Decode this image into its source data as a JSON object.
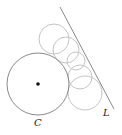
{
  "diagram": {
    "labels": {
      "circle": "C",
      "line": "L"
    },
    "colors": {
      "main_circle": "#8a8a8a",
      "line": "#8a8a8a",
      "small_circles": "#c4c4c4",
      "center_dot": "#111111"
    },
    "main_circle": {
      "cx": 38,
      "cy": 84,
      "r": 31
    },
    "center_dot": {
      "cx": 38,
      "cy": 84,
      "r": 1.8
    },
    "line": {
      "x1": 60,
      "y1": 7,
      "x2": 114,
      "y2": 109
    },
    "tangent_circles": [
      {
        "cx": 54,
        "cy": 39,
        "r": 15
      },
      {
        "cx": 66,
        "cy": 50,
        "r": 13
      },
      {
        "cx": 76,
        "cy": 61,
        "r": 9
      },
      {
        "cx": 80,
        "cy": 77,
        "r": 12
      },
      {
        "cx": 85,
        "cy": 93,
        "r": 17
      }
    ]
  }
}
